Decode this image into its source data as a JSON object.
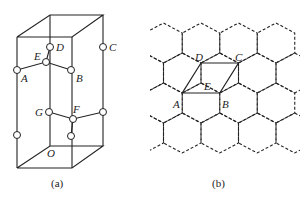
{
  "figure_a": {
    "caption": "(a)",
    "labels": {
      "A": "A",
      "B": "B",
      "C": "C",
      "D": "D",
      "E": "E",
      "F": "F",
      "G": "G",
      "O": "O"
    }
  },
  "figure_b": {
    "caption": "(b)",
    "labels": {
      "A": "A",
      "B": "B",
      "C": "C",
      "D": "D",
      "E": "E"
    }
  }
}
